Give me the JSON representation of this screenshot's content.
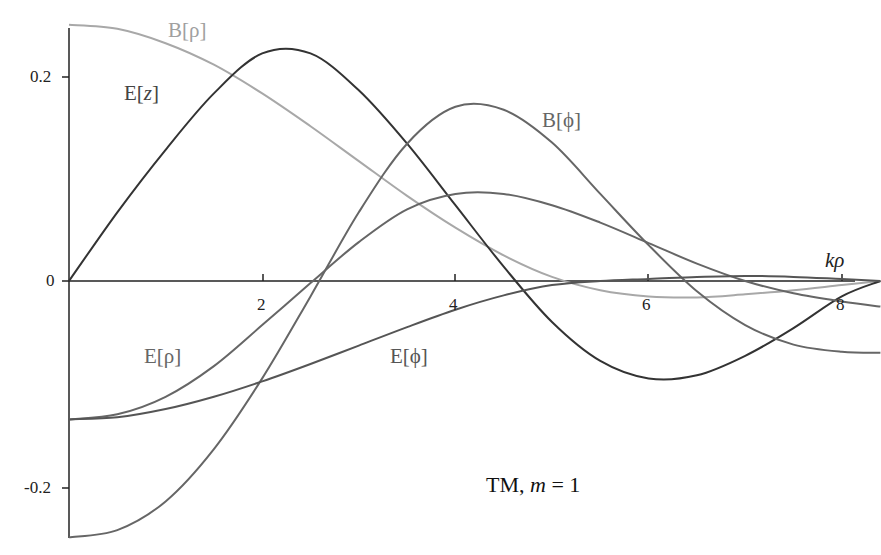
{
  "chart_data": {
    "type": "line",
    "title": "",
    "annotation": "TM, m = 1",
    "xlabel": "kρ",
    "ylabel": "",
    "xlim": [
      0,
      8.4
    ],
    "ylim": [
      -0.27,
      0.26
    ],
    "grid": false,
    "legend": "inline labels",
    "xticks": [
      2,
      4,
      6,
      8
    ],
    "yticks": [
      -0.2,
      0,
      0.2
    ],
    "x": [
      0,
      0.5,
      1,
      1.5,
      2,
      2.5,
      3,
      3.5,
      4,
      4.5,
      5,
      5.5,
      6,
      6.5,
      7,
      7.5,
      8,
      8.4
    ],
    "series": [
      {
        "name": "B[ρ]",
        "color": "#a8a8a8",
        "values": [
          0.25,
          0.246,
          0.232,
          0.211,
          0.183,
          0.151,
          0.117,
          0.083,
          0.052,
          0.025,
          0.004,
          -0.009,
          -0.015,
          -0.016,
          -0.013,
          -0.009,
          -0.004,
          0.0
        ]
      },
      {
        "name": "E[z]",
        "color": "#333333",
        "values": [
          0.0,
          0.067,
          0.128,
          0.183,
          0.222,
          0.222,
          0.186,
          0.134,
          0.074,
          0.014,
          -0.04,
          -0.078,
          -0.095,
          -0.092,
          -0.073,
          -0.046,
          -0.015,
          0.0
        ]
      },
      {
        "name": "B[φ]",
        "color": "#666666",
        "values": [
          -0.25,
          -0.243,
          -0.215,
          -0.164,
          -0.095,
          -0.015,
          0.067,
          0.134,
          0.17,
          0.167,
          0.135,
          0.085,
          0.035,
          -0.01,
          -0.043,
          -0.062,
          -0.069,
          -0.07
        ]
      },
      {
        "name": "E[ρ]",
        "color": "#666666",
        "values": [
          -0.135,
          -0.13,
          -0.113,
          -0.083,
          -0.043,
          -0.002,
          0.038,
          0.07,
          0.085,
          0.085,
          0.074,
          0.057,
          0.037,
          0.017,
          0.0,
          -0.012,
          -0.02,
          -0.025
        ]
      },
      {
        "name": "E[φ]",
        "color": "#555555",
        "values": [
          -0.135,
          -0.133,
          -0.125,
          -0.113,
          -0.098,
          -0.081,
          -0.063,
          -0.045,
          -0.028,
          -0.014,
          -0.004,
          0.0,
          0.002,
          0.004,
          0.005,
          0.004,
          0.002,
          0.0
        ]
      }
    ]
  },
  "labels": {
    "b_rho": "B[ρ]",
    "e_z_prefix": "E[",
    "e_z_var": "z",
    "b_phi": "B[ϕ]",
    "e_rho": "E[ρ]",
    "e_phi": "E[ϕ]",
    "annotation_prefix": "TM, ",
    "annotation_var": "m",
    "annotation_suffix": " = 1",
    "x_axis_label": "kρ"
  },
  "ticks": {
    "x": [
      "2",
      "4",
      "6",
      "8"
    ],
    "y": [
      "0.2",
      "0",
      "-0.2"
    ]
  }
}
